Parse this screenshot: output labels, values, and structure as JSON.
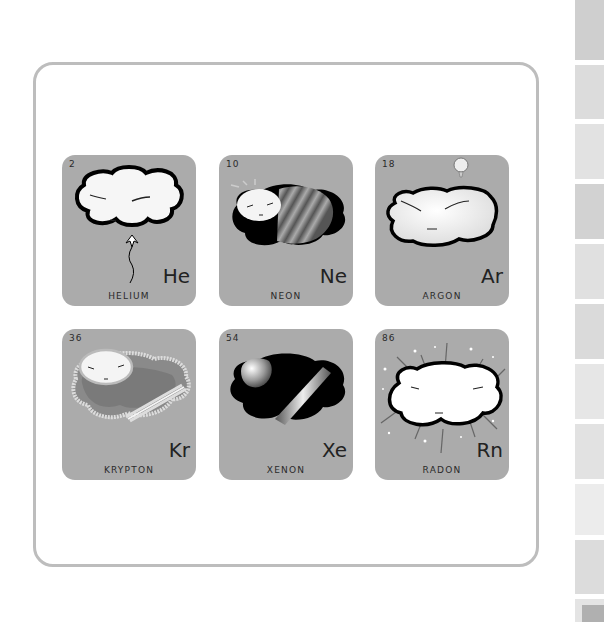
{
  "elements": [
    {
      "number": "2",
      "symbol": "He",
      "name": "HELIUM",
      "icon": "balloon-cloud"
    },
    {
      "number": "10",
      "symbol": "Ne",
      "name": "NEON",
      "icon": "striped-dark-cloud"
    },
    {
      "number": "18",
      "symbol": "Ar",
      "name": "ARGON",
      "icon": "flat-cloud-with-bubble"
    },
    {
      "number": "36",
      "symbol": "Kr",
      "name": "KRYPTON",
      "icon": "glowing-green-cloud"
    },
    {
      "number": "54",
      "symbol": "Xe",
      "name": "XENON",
      "icon": "dark-cloud-with-beam"
    },
    {
      "number": "86",
      "symbol": "Rn",
      "name": "RADON",
      "icon": "radiating-cloud"
    }
  ],
  "colors": {
    "card_bg": "#ababab",
    "frame_border": "#bdbdbd",
    "text": "#222222",
    "strip_tabs": [
      "#cfcfcf",
      "#dcdcdc",
      "#e2e2e2",
      "#d2d2d2",
      "#e0e0e0",
      "#dadada",
      "#e6e6e6",
      "#e2e2e2",
      "#ececec",
      "#dcdcdc",
      "#e4e4e4"
    ]
  }
}
